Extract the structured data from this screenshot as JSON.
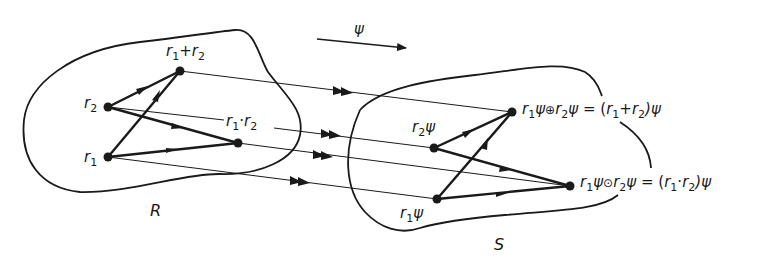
{
  "diagram": {
    "mapping": {
      "symbol": "ψ"
    },
    "sets": {
      "domain": {
        "name": "R"
      },
      "codomain": {
        "name": "S"
      }
    },
    "domain_points": {
      "r1": "r",
      "r1_sub": "1",
      "r2": "r",
      "r2_sub": "2",
      "sum": {
        "a": "r",
        "a_sub": "1",
        "op": "+",
        "b": "r",
        "b_sub": "2"
      },
      "product": {
        "a": "r",
        "a_sub": "1",
        "op": "·",
        "b": "r",
        "b_sub": "2"
      }
    },
    "codomain_points": {
      "r1psi": {
        "base": "r",
        "sub": "1",
        "psi": "ψ"
      },
      "r2psi": {
        "base": "r",
        "sub": "2",
        "psi": "ψ"
      },
      "sum": {
        "lhs_a": "r",
        "lhs_a_sub": "1",
        "lhs_psi1": "ψ",
        "op": "⊕",
        "lhs_b": "r",
        "lhs_b_sub": "2",
        "lhs_psi2": "ψ",
        "eq": " = (",
        "rhs_a": "r",
        "rhs_a_sub": "1",
        "rhs_op": "+",
        "rhs_b": "r",
        "rhs_b_sub": "2",
        "rhs_close": ")ψ"
      },
      "product": {
        "lhs_a": "r",
        "lhs_a_sub": "1",
        "lhs_psi1": "ψ",
        "op": "⊙",
        "lhs_b": "r",
        "lhs_b_sub": "2",
        "lhs_psi2": "ψ",
        "eq": " = (",
        "rhs_a": "r",
        "rhs_a_sub": "1",
        "rhs_op": "·",
        "rhs_b": "r",
        "rhs_b_sub": "2",
        "rhs_close": ")ψ"
      }
    },
    "colors": {
      "ink": "#1a1a1a",
      "background": "#ffffff"
    }
  }
}
